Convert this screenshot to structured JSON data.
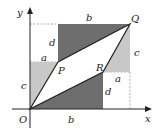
{
  "diagram": {
    "axes": {
      "x_label": "x",
      "y_label": "y"
    },
    "points": {
      "O": {
        "label": "O",
        "x": 30,
        "y": 109
      },
      "P": {
        "label": "P",
        "x": 58,
        "y": 62
      },
      "Q": {
        "label": "Q",
        "x": 130,
        "y": 24
      },
      "R": {
        "label": "R",
        "x": 103,
        "y": 72
      }
    },
    "segment_labels": {
      "top_b": "b",
      "bottom_b": "b",
      "left_d": "d",
      "right_d": "d",
      "left_c": "c",
      "right_c": "c",
      "top_a": "a",
      "right_a": "a"
    },
    "colors": {
      "dark_fill": "#6e6e6e",
      "light_fill": "#c8c8c8",
      "line": "#222222",
      "dashed": "#9a9a9a",
      "background": "#ffffff"
    }
  }
}
